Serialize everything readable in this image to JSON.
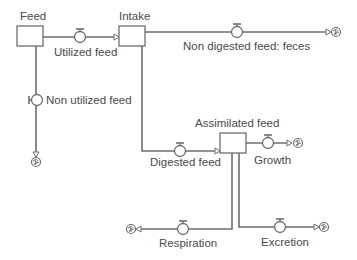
{
  "diagram": {
    "type": "stock-and-flow",
    "colors": {
      "line": "#6e6e6e",
      "stock_fill": "#ffffff",
      "text": "#4a4a4a"
    },
    "stocks": [
      {
        "id": "feed",
        "label": "Feed"
      },
      {
        "id": "intake",
        "label": "Intake"
      },
      {
        "id": "assimilated",
        "label": "Assimilated feed"
      }
    ],
    "flows": [
      {
        "id": "utilized",
        "label": "Utilized feed",
        "from": "Feed",
        "to": "Intake"
      },
      {
        "id": "non_utilized",
        "label": "Non utilized feed",
        "from": "Feed",
        "to": "cloud-sink"
      },
      {
        "id": "feces",
        "label": "Non digested feed: feces",
        "from": "Intake",
        "to": "cloud-sink"
      },
      {
        "id": "digested",
        "label": "Digested feed",
        "from": "Intake",
        "to": "Assimilated feed"
      },
      {
        "id": "growth",
        "label": "Growth",
        "from": "Assimilated feed",
        "to": "cloud-sink"
      },
      {
        "id": "respiration",
        "label": "Respiration",
        "from": "Assimilated feed",
        "to": "cloud-sink"
      },
      {
        "id": "excretion",
        "label": "Excretion",
        "from": "Assimilated feed",
        "to": "cloud-sink"
      }
    ],
    "icons": {
      "valve": "valve-icon",
      "cloud": "cloud-sink-icon",
      "arrow": "arrowhead-icon"
    }
  }
}
